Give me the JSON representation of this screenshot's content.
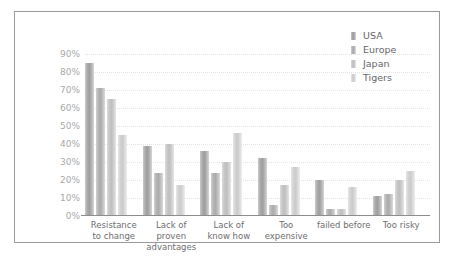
{
  "chart_data": {
    "type": "bar",
    "title": "",
    "xlabel": "",
    "ylabel": "",
    "ylim": [
      0,
      90
    ],
    "grid": true,
    "legend_position": "top-right",
    "ytick_labels": [
      "90%",
      "80%",
      "70%",
      "60%",
      "50%",
      "40%",
      "30%",
      "20%",
      "10%",
      "0%"
    ],
    "ytick_values": [
      90,
      80,
      70,
      60,
      50,
      40,
      30,
      20,
      10,
      0
    ],
    "categories": [
      "Resistance to change",
      "Lack of proven advantages",
      "Lack of know how",
      "Too expensive",
      "failed before",
      "Too risky"
    ],
    "series": [
      {
        "name": "USA",
        "color": "#a9a9a9",
        "values": [
          85,
          39,
          36,
          32,
          20,
          11
        ]
      },
      {
        "name": "Europe",
        "color": "#b4b4b4",
        "values": [
          71,
          24,
          24,
          6,
          4,
          12
        ]
      },
      {
        "name": "Japan",
        "color": "#c6c6c6",
        "values": [
          65,
          40,
          30,
          17,
          4,
          20
        ]
      },
      {
        "name": "Tigers",
        "color": "#d2d2d2",
        "values": [
          45,
          17,
          46,
          27,
          16,
          25
        ]
      }
    ]
  },
  "legend": {
    "items": [
      {
        "label": "USA"
      },
      {
        "label": "Europe"
      },
      {
        "label": "Japan"
      },
      {
        "label": "Tigers"
      }
    ]
  }
}
